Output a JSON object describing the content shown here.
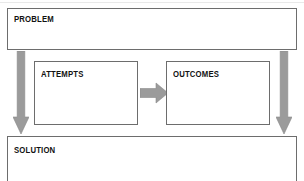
{
  "diagram": {
    "type": "problem-solution-flow",
    "palette": {
      "box_border": "#6d6d6d",
      "box_fill": "#ffffff",
      "arrow_fill": "#9b9b9b",
      "arrow_stroke": "#8a8a8a",
      "text": "#121212",
      "page_background": "#ffffff"
    },
    "boxes": [
      {
        "id": "problem",
        "label": "PROBLEM"
      },
      {
        "id": "attempts",
        "label": "ATTEMPTS"
      },
      {
        "id": "outcomes",
        "label": "OUTCOMES"
      },
      {
        "id": "solution",
        "label": "SOLUTION"
      }
    ],
    "arrows": [
      {
        "id": "left-down",
        "direction": "down",
        "from": "problem",
        "to": "solution"
      },
      {
        "id": "right-down",
        "direction": "down",
        "from": "problem",
        "to": "solution"
      },
      {
        "id": "middle-right",
        "direction": "right",
        "from": "attempts",
        "to": "outcomes"
      }
    ]
  }
}
